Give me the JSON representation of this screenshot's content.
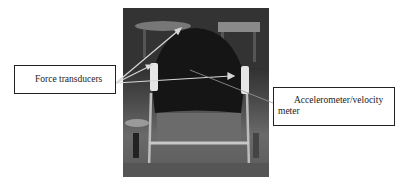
{
  "figure": {
    "photo_description": "Wheelchair-mounted rowing/kayak seat rig with sensors",
    "labels": {
      "force": "Force transducers",
      "accel": "Accelerometer/velocity meter"
    },
    "colors": {
      "background": "#ffffff",
      "box_border": "#222222",
      "text": "#222222",
      "arrow": "#d8d8d8"
    }
  }
}
